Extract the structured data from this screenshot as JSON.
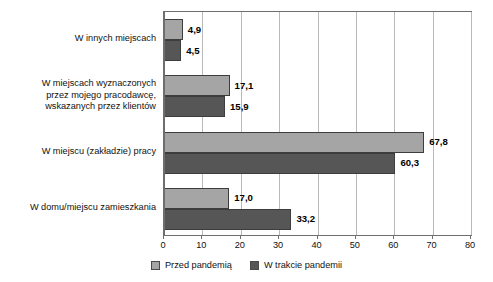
{
  "chart_data": {
    "type": "bar",
    "orientation": "horizontal",
    "title": "",
    "xlabel": "",
    "ylabel": "",
    "xlim": [
      0,
      80
    ],
    "xticks": [
      "0",
      "10",
      "20",
      "30",
      "40",
      "50",
      "60",
      "70",
      "80"
    ],
    "grid": "vertical",
    "legend_position": "bottom",
    "categories": [
      "W domu/miejscu zamieszkania",
      "W miejscu (zakładzie) pracy",
      "W miejscach wyznaczonych przez mojego pracodawcę, wskazanych przez klientów",
      "W innych miejscach"
    ],
    "category_lines": [
      [
        "W domu/miejscu zamieszkania"
      ],
      [
        "W miejscu (zakładzie) pracy"
      ],
      [
        "W miejscach wyznaczonych",
        "przez mojego pracodawcę,",
        "wskazanych przez klientów"
      ],
      [
        "W innych miejscach"
      ]
    ],
    "series": [
      {
        "name": "Przed pandemią",
        "color": "#a5a5a5",
        "values": [
          17.0,
          67.8,
          17.1,
          4.9
        ],
        "labels": [
          "17,0",
          "67,8",
          "17,1",
          "4,9"
        ]
      },
      {
        "name": "W trakcie pandemii",
        "color": "#565656",
        "values": [
          33.2,
          60.3,
          15.9,
          4.5
        ],
        "labels": [
          "33,2",
          "60,3",
          "15,9",
          "4,5"
        ]
      }
    ]
  },
  "legend": {
    "items": [
      {
        "label": "Przed pandemią",
        "color": "#a5a5a5"
      },
      {
        "label": "W trakcie pandemii",
        "color": "#565656"
      }
    ]
  }
}
